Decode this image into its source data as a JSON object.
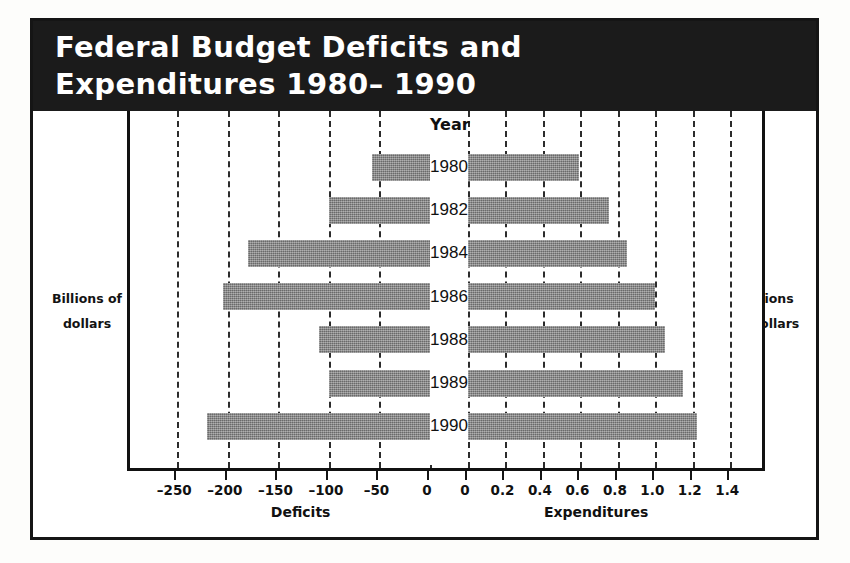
{
  "title": {
    "line1": "Federal Budget Deficits and",
    "line2": "Expenditures  1980– 1990"
  },
  "captions": {
    "left_line1": "Billions of",
    "left_line2": "dollars",
    "right_line1": "Trillions",
    "right_line2": "of dollars"
  },
  "year_header": "Year",
  "colors": {
    "band_background": "#1b1b1b",
    "title_text": "#ffffff",
    "bar_fill": "#808080",
    "frame": "#151515",
    "gridline": "#2c2c2c",
    "page_background": "#ffffff"
  },
  "chart_data": {
    "type": "bar",
    "orientation": "horizontal",
    "layout": "back-to-back bidirectional panels with centered year labels",
    "grid": true,
    "legend": null,
    "categories": [
      "1980",
      "1982",
      "1984",
      "1986",
      "1988",
      "1989",
      "1990"
    ],
    "panels": [
      {
        "name": "Deficits",
        "xlabel": "Deficits",
        "unit_label": "Billions of dollars",
        "side": "left",
        "xlim": [
          -275,
          0
        ],
        "ticks": [
          -250,
          -200,
          -150,
          -100,
          -50,
          0
        ],
        "tick_labels": [
          "–250",
          "–200",
          "–150",
          "–100",
          "–50",
          "0"
        ],
        "values": [
          -57,
          -100,
          -180,
          -205,
          -110,
          -100,
          -221
        ]
      },
      {
        "name": "Expenditures",
        "xlabel": "Expenditures",
        "unit_label": "Trillions of dollars",
        "side": "right",
        "xlim": [
          0,
          1.5
        ],
        "ticks": [
          0,
          0.2,
          0.4,
          0.6,
          0.8,
          1.0,
          1.2,
          1.4
        ],
        "tick_labels": [
          "0",
          "0.2",
          "0.4",
          "0.6",
          "0.8",
          "1.0",
          "1.2",
          "1.4"
        ],
        "values": [
          0.59,
          0.75,
          0.85,
          1.0,
          1.05,
          1.15,
          1.22
        ]
      }
    ]
  }
}
